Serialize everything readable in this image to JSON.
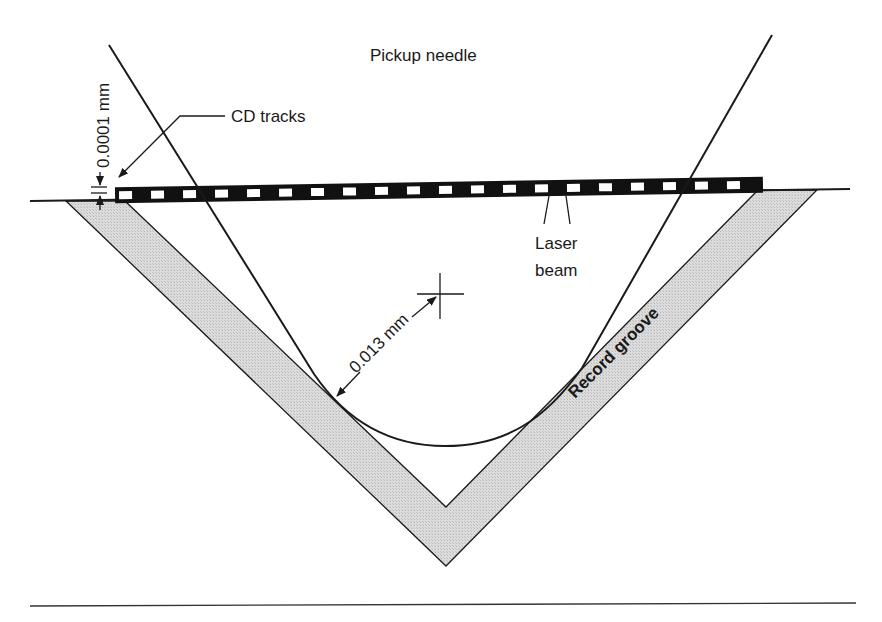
{
  "figure": {
    "title": "Pickup needle",
    "labels": {
      "cd_tracks": "CD tracks",
      "track_thickness": "0.0001 mm",
      "laser_line1": "Laser",
      "laser_line2": "beam",
      "needle_radius": "0.013 mm",
      "record_groove": "Record groove"
    },
    "colors": {
      "ink": "#1a1a1a",
      "groove_fill": "#d9d9d9",
      "cd_strip": "#111111",
      "cd_pit": "#ffffff",
      "background": "#ffffff"
    },
    "cd_pit_count": 20
  }
}
